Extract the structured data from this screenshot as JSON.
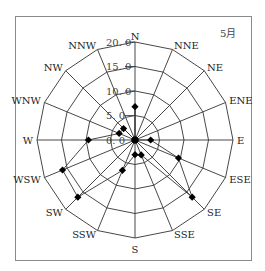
{
  "chart_data": {
    "type": "radar",
    "title": "5月",
    "directions": [
      "N",
      "NNE",
      "NE",
      "ENE",
      "E",
      "ESE",
      "SE",
      "SSE",
      "S",
      "SSW",
      "SW",
      "WSW",
      "W",
      "WNW",
      "NW",
      "NNW"
    ],
    "values": [
      6.8,
      0,
      0,
      0,
      3.2,
      9.6,
      16.5,
      3.3,
      3.0,
      6.7,
      16.5,
      16.0,
      9.5,
      3.5,
      3.3,
      0
    ],
    "rings": [
      0,
      5,
      10,
      15,
      20
    ],
    "ring_labels": [
      "0. 0",
      "5. 0",
      "10. 0",
      "15. 0",
      "20. 0"
    ],
    "rmax": 20,
    "grid": "polygon",
    "marker": "diamond"
  },
  "colors": {
    "line": "#333333",
    "marker": "#000000",
    "frame": "#8a8a8a"
  }
}
